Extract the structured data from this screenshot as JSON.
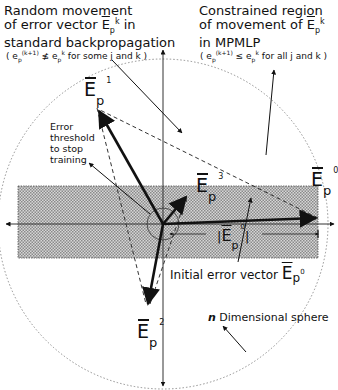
{
  "diagram": {
    "labels": {
      "left_title_line1": "Random movement",
      "left_title_line2": "of error vector ",
      "left_title_line3": "standard backpropagation",
      "left_title_suffix": " in",
      "left_condition": "( e_p^(k+1) ≰ e_p^k for some j and k )",
      "left_cond_prefix": "( e",
      "left_cond_sup": "(k+1)",
      "left_cond_rel": " ≰ e",
      "left_cond_sup2": "k",
      "left_cond_tail": " for some j and k )",
      "right_title_line1": "Constrained region",
      "right_title_line2": "of movement of ",
      "right_title_line3": "in MPMLP",
      "right_cond_prefix": "( e",
      "right_cond_sup": "(k+1)",
      "right_cond_rel": " ≤ e",
      "right_cond_sup2": "k",
      "right_cond_tail": " for all j and k )",
      "threshold_line1": "Error",
      "threshold_line2": "threshold",
      "threshold_line3": "to stop",
      "threshold_line4": "training",
      "initial_vector": "Initial error vector ",
      "sphere_n": "n",
      "sphere_label": " Dimensional sphere",
      "magnitude_label": "|E_p^0|"
    },
    "vectors": [
      {
        "id": "E0",
        "symbol": "E",
        "subscript": "p",
        "superscript": "0",
        "tip": [
          318,
          218
        ]
      },
      {
        "id": "E1",
        "symbol": "E",
        "subscript": "p",
        "superscript": "1",
        "tip": [
          97,
          108
        ]
      },
      {
        "id": "E2",
        "symbol": "E",
        "subscript": "p",
        "superscript": "2",
        "tip": [
          148,
          306
        ]
      },
      {
        "id": "E3",
        "symbol": "E",
        "subscript": "p",
        "superscript": "3",
        "tip": [
          188,
          195
        ]
      }
    ],
    "geometry": {
      "origin": [
        163,
        224
      ],
      "sphere_radius": 165,
      "threshold_radius": 16,
      "band": {
        "x": 18,
        "y": 186,
        "width": 300,
        "height": 72
      }
    },
    "colors": {
      "ink": "#111111",
      "band_fill": "#bdbdbd",
      "dotted": "#777777"
    }
  }
}
